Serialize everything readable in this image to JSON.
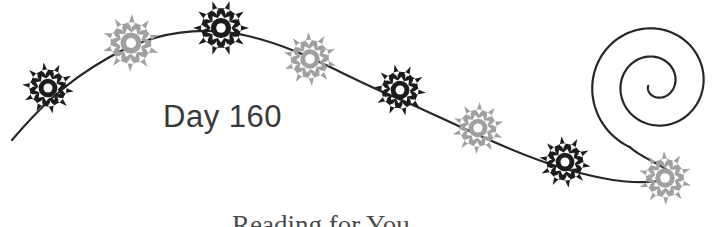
{
  "canvas": {
    "width": 728,
    "height": 227,
    "background_color": "#ffffff"
  },
  "title_text": {
    "label": "Day 160"
  },
  "caption_text": {
    "label": "Reading for You"
  },
  "colors": {
    "dark_flower": "#1c1c1c",
    "gray_flower": "#a0a0a0",
    "flower_center": "#ffffff",
    "vine_stroke": "#262626",
    "text": "#3a3a3a",
    "background": "#ffffff"
  },
  "vine": {
    "stroke_width": 2.2,
    "path": "M 12,140 C 36,112 62,84 108,58 C 150,34 196,24 248,36 C 300,48 340,74 392,96 C 440,116 500,148 556,166 C 600,180 636,186 664,180"
  },
  "spiral": {
    "stroke_width": 2.2,
    "turns": 2.15,
    "center_x": 655,
    "center_y": 84,
    "start_radius": 68,
    "end_radius": 7
  },
  "flowers": [
    {
      "id": "flower-1",
      "tone": "dark",
      "cx": 48,
      "cy": 88,
      "radius": 26,
      "petals": 10,
      "rotation": 8,
      "center_radius": 4.5
    },
    {
      "id": "flower-2",
      "tone": "gray",
      "cx": 131,
      "cy": 43,
      "radius": 29,
      "petals": 10,
      "rotation": 20,
      "center_radius": 5.0
    },
    {
      "id": "flower-3",
      "tone": "dark",
      "cx": 221,
      "cy": 28,
      "radius": 28,
      "petals": 10,
      "rotation": 0,
      "center_radius": 4.8
    },
    {
      "id": "flower-4",
      "tone": "gray",
      "cx": 310,
      "cy": 59,
      "radius": 27,
      "petals": 10,
      "rotation": 14,
      "center_radius": 4.8
    },
    {
      "id": "flower-5",
      "tone": "dark",
      "cx": 400,
      "cy": 90,
      "radius": 26,
      "petals": 10,
      "rotation": 6,
      "center_radius": 4.5
    },
    {
      "id": "flower-6",
      "tone": "gray",
      "cx": 478,
      "cy": 128,
      "radius": 26,
      "petals": 10,
      "rotation": 22,
      "center_radius": 4.6
    },
    {
      "id": "flower-7",
      "tone": "dark",
      "cx": 565,
      "cy": 162,
      "radius": 26,
      "petals": 10,
      "rotation": 10,
      "center_radius": 4.5
    },
    {
      "id": "flower-8",
      "tone": "gray",
      "cx": 665,
      "cy": 178,
      "radius": 27,
      "petals": 10,
      "rotation": 16,
      "center_radius": 4.8
    }
  ]
}
